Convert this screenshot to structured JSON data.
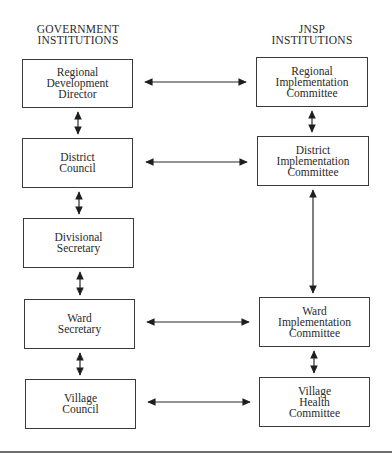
{
  "columns": {
    "government": {
      "header": [
        "GOVERNMENT",
        "INSTITUTIONS"
      ]
    },
    "jnsp": {
      "header": [
        "JNSP",
        "INSTITUTIONS"
      ]
    }
  },
  "government_boxes": [
    {
      "id": "regional-development-director",
      "lines": [
        "Regional",
        "Development",
        "Director"
      ]
    },
    {
      "id": "district-council",
      "lines": [
        "District",
        "Council"
      ]
    },
    {
      "id": "divisional-secretary",
      "lines": [
        "Divisional",
        "Secretary"
      ]
    },
    {
      "id": "ward-secretary",
      "lines": [
        "Ward",
        "Secretary"
      ]
    },
    {
      "id": "village-council",
      "lines": [
        "Village",
        "Council"
      ]
    }
  ],
  "jnsp_boxes": [
    {
      "id": "regional-implementation-committee",
      "lines": [
        "Regional",
        "Implementation",
        "Committee"
      ]
    },
    {
      "id": "district-implementation-committee",
      "lines": [
        "District",
        "Implementation",
        "Committee"
      ]
    },
    {
      "id": "ward-implementation-committee",
      "lines": [
        "Ward",
        "Implementation",
        "Committee"
      ]
    },
    {
      "id": "village-health-committee",
      "lines": [
        "Village",
        "Health",
        "Committee"
      ]
    }
  ],
  "connections": [
    {
      "from": "regional-development-director",
      "to": "regional-implementation-committee",
      "type": "bidirectional"
    },
    {
      "from": "district-council",
      "to": "district-implementation-committee",
      "type": "bidirectional"
    },
    {
      "from": "ward-secretary",
      "to": "ward-implementation-committee",
      "type": "bidirectional"
    },
    {
      "from": "village-council",
      "to": "village-health-committee",
      "type": "bidirectional"
    },
    {
      "from": "regional-development-director",
      "to": "district-council",
      "type": "bidirectional"
    },
    {
      "from": "district-council",
      "to": "divisional-secretary",
      "type": "bidirectional"
    },
    {
      "from": "divisional-secretary",
      "to": "ward-secretary",
      "type": "bidirectional"
    },
    {
      "from": "ward-secretary",
      "to": "village-council",
      "type": "bidirectional"
    },
    {
      "from": "regional-implementation-committee",
      "to": "district-implementation-committee",
      "type": "bidirectional"
    },
    {
      "from": "district-implementation-committee",
      "to": "ward-implementation-committee",
      "type": "bidirectional"
    },
    {
      "from": "ward-implementation-committee",
      "to": "village-health-committee",
      "type": "bidirectional"
    }
  ],
  "colors": {
    "line": "#2a2a2a",
    "border": "#3a3a3a",
    "rule": "#6e6e6e"
  }
}
